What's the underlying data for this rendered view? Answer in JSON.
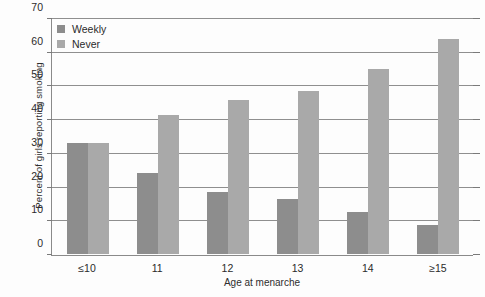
{
  "chart_data": {
    "type": "bar",
    "title": "",
    "xlabel": "Age at menarche",
    "ylabel": "Percent of girls reporting smoking",
    "categories": [
      "≤10",
      "11",
      "12",
      "13",
      "14",
      "≥15"
    ],
    "series": [
      {
        "name": "Weekly",
        "color": "#8d8d8d",
        "values": [
          33,
          24,
          18.5,
          16.5,
          12.5,
          8.5
        ]
      },
      {
        "name": "Never",
        "color": "#a9a9a9",
        "values": [
          33,
          41.5,
          46,
          48.5,
          55,
          64
        ]
      }
    ],
    "ylim": [
      0,
      70
    ],
    "yticks": [
      0,
      10,
      20,
      30,
      40,
      50,
      60,
      70
    ],
    "ytick_labels": [
      "0",
      "10",
      "20",
      "30",
      "40",
      "50",
      "60",
      "70"
    ],
    "grid": true,
    "grid_axis": "y",
    "legend_position": "top-left",
    "legend_entries": [
      "Weekly",
      "Never"
    ]
  },
  "axis": {
    "y_title": "Percent of girls reporting smoking",
    "x_title": "Age at menarche"
  }
}
